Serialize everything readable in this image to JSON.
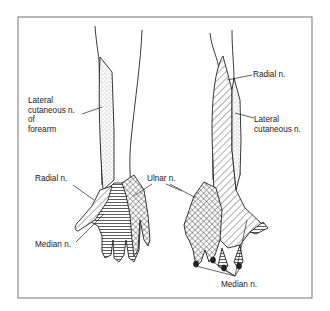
{
  "figure": {
    "frame": {
      "x": 18,
      "y": 17,
      "width": 294,
      "height": 281,
      "stroke": "#666666"
    }
  },
  "labels": {
    "left_lateral_cutaneous": "Lateral\ncutaneous n.\nof\nforearm",
    "left_radial": "Radial n.",
    "left_median": "Median n.",
    "ulnar": "Ulnar n.",
    "right_radial": "Radial n.",
    "right_lateral_cutaneous": "Lateral\ncutaneous n.",
    "right_median": "Median n."
  },
  "regions": {
    "lateral_cutaneous": {
      "pattern": "stipple",
      "name": "Lateral cutaneous n."
    },
    "radial": {
      "pattern": "diagonal-hatch",
      "name": "Radial n."
    },
    "median": {
      "pattern": "horizontal-lines",
      "name": "Median n."
    },
    "ulnar": {
      "pattern": "cross-hatch",
      "name": "Ulnar n."
    }
  },
  "colors": {
    "ink": "#222222",
    "frame": "#666666",
    "background": "#ffffff"
  }
}
